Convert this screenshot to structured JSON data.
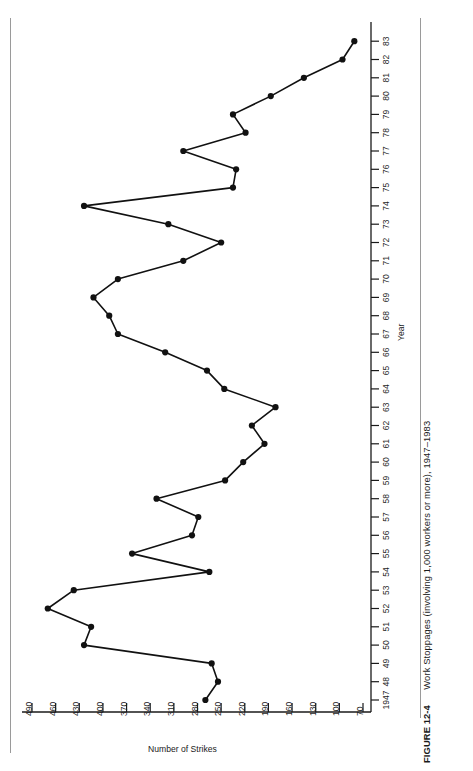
{
  "figure": {
    "number_label": "FIGURE 12-4",
    "caption": "Work Stoppages (involving 1,000 workers or more), 1947–1983"
  },
  "axes": {
    "x_title": "Year",
    "y_title": "Number of Strikes"
  },
  "chart_data": {
    "type": "line",
    "title": "Work Stoppages (involving 1,000 workers or more), 1947–1983",
    "xlabel": "Year",
    "ylabel": "Number of Strikes",
    "orientation": "rotated-90-counterclockwise",
    "xlim": [
      1947,
      1983
    ],
    "ylim": [
      55,
      505
    ],
    "grid": false,
    "legend": false,
    "marker": "filled-circle",
    "line_color": "#111111",
    "x_tick_labels": [
      "1947",
      "48",
      "49",
      "50",
      "51",
      "52",
      "53",
      "54",
      "55",
      "56",
      "57",
      "58",
      "59",
      "60",
      "61",
      "62",
      "63",
      "64",
      "65",
      "66",
      "67",
      "68",
      "69",
      "70",
      "71",
      "72",
      "73",
      "74",
      "75",
      "76",
      "77",
      "78",
      "79",
      "80",
      "81",
      "82",
      "83"
    ],
    "y_tick_labels": [
      "490",
      "460",
      "430",
      "400",
      "370",
      "340",
      "310",
      "280",
      "250",
      "220",
      "190",
      "160",
      "130",
      "100",
      "70"
    ],
    "y_ticks": [
      490,
      460,
      430,
      400,
      370,
      340,
      310,
      280,
      250,
      220,
      190,
      160,
      130,
      100,
      70
    ],
    "x": [
      1947,
      1948,
      1949,
      1950,
      1951,
      1952,
      1953,
      1954,
      1955,
      1956,
      1957,
      1958,
      1959,
      1960,
      1961,
      1962,
      1963,
      1964,
      1965,
      1966,
      1967,
      1968,
      1969,
      1970,
      1971,
      1972,
      1973,
      1974,
      1975,
      1976,
      1977,
      1978,
      1979,
      1980,
      1981,
      1982,
      1983
    ],
    "values": [
      270,
      254,
      262,
      424,
      415,
      470,
      437,
      265,
      363,
      287,
      279,
      332,
      245,
      222,
      195,
      211,
      181,
      246,
      268,
      321,
      381,
      392,
      412,
      381,
      298,
      250,
      317,
      424,
      235,
      231,
      298,
      219,
      235,
      187,
      145,
      96,
      81
    ]
  }
}
